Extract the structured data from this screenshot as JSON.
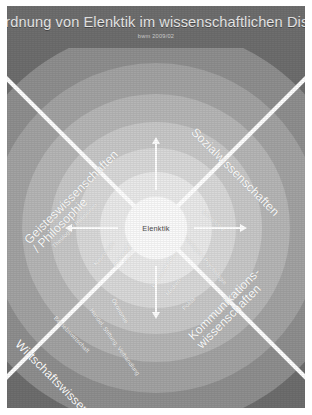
{
  "slide": {
    "title": "Einordnung von Elenktik im wissenschaftlichen Diskurs",
    "subtitle": "bwm 2009/02",
    "background_color": "#6e6e6e",
    "divider_color": "#ffffff"
  },
  "center": {
    "label": "Elenktik"
  },
  "quadrants": [
    {
      "id": "geisteswissenschaften",
      "label": "Geisteswissenschaften / Philosophie",
      "position": "upper-left"
    },
    {
      "id": "sozialwissenschaften",
      "label": "Sozialwissenschaften",
      "position": "upper-right"
    },
    {
      "id": "wirtschaftswissenschaften",
      "label": "Wirtschaftswissenschaften",
      "position": "lower-left"
    },
    {
      "id": "kommunikationswissenschaften",
      "label": "Kommunikations-wissenschaften",
      "position": "lower-right"
    }
  ],
  "quadrant_labels": {
    "geist_line1": "Geisteswissenschaften",
    "geist_line2": "/ Philosophie",
    "sozial": "Sozialwissenschaften",
    "wirtschaft": "Wirtschaftswissenschaften",
    "komm_line1": "Kommunikations-",
    "komm_line2": "wissenschaften"
  },
  "ring_labels": {
    "theologie": "Theologie / Religionen",
    "neurologie": "Neurologie",
    "philosophie": "Philosophie",
    "paedagogik": "Pädagogik",
    "ethnologie": "Ethnologie",
    "soziologie": "Soziologie / Psychologie",
    "betriebswirtschaft": "Betriebswirtschaft",
    "handel": "Handel, Stiftung, Verhandlung",
    "oekonomie": "Ökonomie",
    "politik": "Politik",
    "medien": "Medien-",
    "kommunikation": "kommunikation"
  },
  "rings": {
    "colors": [
      "#8f8f8f",
      "#a3a3a3",
      "#b6b6b6",
      "#c8c8c8",
      "#d9d9d9",
      "#eaeaea",
      "#fbfbfb"
    ],
    "count": 7
  },
  "arrows": {
    "count": 4,
    "directions": [
      "top",
      "right",
      "bottom",
      "left"
    ],
    "color": "#ffffff"
  }
}
